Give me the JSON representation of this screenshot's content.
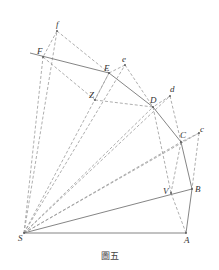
{
  "figure": {
    "caption": "圖五",
    "colors": {
      "solid": "#777777",
      "dashed": "#999999",
      "label": "#333333"
    },
    "points": [
      {
        "id": "S",
        "x": 24,
        "y": 233,
        "lx": 18,
        "ly": 241
      },
      {
        "id": "A",
        "x": 186,
        "y": 233,
        "lx": 184,
        "ly": 243
      },
      {
        "id": "B",
        "x": 192,
        "y": 189,
        "lx": 195,
        "ly": 192
      },
      {
        "id": "V",
        "x": 171,
        "y": 193,
        "lx": 163,
        "ly": 194
      },
      {
        "id": "C",
        "x": 181,
        "y": 142,
        "lx": 180,
        "ly": 138
      },
      {
        "id": "c",
        "x": 199,
        "y": 133,
        "lx": 200,
        "ly": 132
      },
      {
        "id": "D",
        "x": 153,
        "y": 107,
        "lx": 150,
        "ly": 103
      },
      {
        "id": "d",
        "x": 170,
        "y": 96,
        "lx": 170,
        "ly": 92
      },
      {
        "id": "E",
        "x": 109,
        "y": 73,
        "lx": 104,
        "ly": 71
      },
      {
        "id": "e",
        "x": 125,
        "y": 65,
        "lx": 122,
        "ly": 62
      },
      {
        "id": "Z",
        "x": 95,
        "y": 100,
        "lx": 89,
        "ly": 98
      },
      {
        "id": "F",
        "x": 43,
        "y": 57,
        "lx": 37,
        "ly": 54
      },
      {
        "id": "f",
        "x": 57,
        "y": 31,
        "lx": 56,
        "ly": 27
      }
    ],
    "solid_lines": [
      {
        "x1": 30,
        "y1": 53,
        "x2": 109,
        "y2": 73
      },
      {
        "x1": 109,
        "y1": 73,
        "x2": 153,
        "y2": 107
      },
      {
        "x1": 153,
        "y1": 107,
        "x2": 181,
        "y2": 142
      },
      {
        "x1": 181,
        "y1": 142,
        "x2": 192,
        "y2": 189
      },
      {
        "x1": 192,
        "y1": 189,
        "x2": 186,
        "y2": 233
      },
      {
        "x1": 24,
        "y1": 233,
        "x2": 186,
        "y2": 233
      },
      {
        "x1": 24,
        "y1": 233,
        "x2": 192,
        "y2": 189
      }
    ],
    "dashed_lines": [
      {
        "x1": 24,
        "y1": 233,
        "x2": 43,
        "y2": 57
      },
      {
        "x1": 24,
        "y1": 233,
        "x2": 57,
        "y2": 31
      },
      {
        "x1": 24,
        "y1": 233,
        "x2": 109,
        "y2": 73
      },
      {
        "x1": 24,
        "y1": 233,
        "x2": 125,
        "y2": 65
      },
      {
        "x1": 24,
        "y1": 233,
        "x2": 153,
        "y2": 107
      },
      {
        "x1": 24,
        "y1": 233,
        "x2": 170,
        "y2": 96
      },
      {
        "x1": 24,
        "y1": 233,
        "x2": 181,
        "y2": 142
      },
      {
        "x1": 24,
        "y1": 233,
        "x2": 199,
        "y2": 133
      },
      {
        "x1": 57,
        "y1": 31,
        "x2": 43,
        "y2": 57
      },
      {
        "x1": 57,
        "y1": 31,
        "x2": 109,
        "y2": 73
      },
      {
        "x1": 43,
        "y1": 57,
        "x2": 95,
        "y2": 100
      },
      {
        "x1": 95,
        "y1": 100,
        "x2": 153,
        "y2": 107
      },
      {
        "x1": 125,
        "y1": 65,
        "x2": 109,
        "y2": 73
      },
      {
        "x1": 125,
        "y1": 65,
        "x2": 153,
        "y2": 107
      },
      {
        "x1": 109,
        "y1": 73,
        "x2": 95,
        "y2": 100
      },
      {
        "x1": 170,
        "y1": 96,
        "x2": 153,
        "y2": 107
      },
      {
        "x1": 170,
        "y1": 96,
        "x2": 181,
        "y2": 142
      },
      {
        "x1": 153,
        "y1": 107,
        "x2": 171,
        "y2": 193
      },
      {
        "x1": 199,
        "y1": 133,
        "x2": 181,
        "y2": 142
      },
      {
        "x1": 199,
        "y1": 133,
        "x2": 192,
        "y2": 189
      },
      {
        "x1": 181,
        "y1": 142,
        "x2": 171,
        "y2": 193
      },
      {
        "x1": 171,
        "y1": 193,
        "x2": 186,
        "y2": 233
      }
    ]
  }
}
